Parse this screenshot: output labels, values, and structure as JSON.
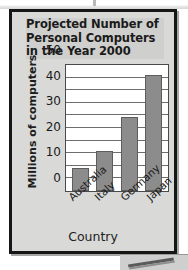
{
  "figure": {
    "title_lines": [
      "Projected Number of",
      "Personal Computers",
      "in the Year 2000"
    ],
    "frame_color": "#161616",
    "background_color": "#d9d9d7"
  },
  "chart_data": {
    "type": "bar",
    "title": "Projected Number of Personal Computers in the Year 2000",
    "xlabel": "Country",
    "ylabel": "Millions of computers",
    "categories": [
      "Australia",
      "Italy",
      "Germany",
      "Japan"
    ],
    "values": [
      9,
      16,
      29.5,
      46
    ],
    "ylim": [
      0,
      50
    ],
    "yticks": [
      0,
      10,
      20,
      30,
      40,
      50
    ],
    "gridline_values": [
      5,
      10,
      15,
      20,
      25,
      30,
      35,
      40,
      45,
      50
    ],
    "grid": true,
    "legend": "none",
    "bar_color": "#8c8c8c",
    "bar_edge_color": "#5d5d5d",
    "plot_background": "#ffffff"
  }
}
